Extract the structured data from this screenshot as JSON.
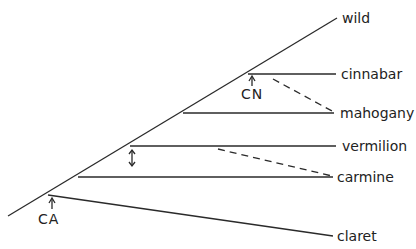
{
  "diagram": {
    "type": "phylogenetic-tree",
    "trunk_label": "wild",
    "branches": [
      {
        "label": "cinnabar"
      },
      {
        "label": "mahogany"
      },
      {
        "label": "vermilion"
      },
      {
        "label": "carmine"
      },
      {
        "label": "claret"
      }
    ],
    "markers": [
      {
        "label": "CN",
        "arrow": "up"
      },
      {
        "label": "V",
        "arrow": "double"
      },
      {
        "label": "CA",
        "arrow": "up"
      }
    ],
    "colors": {
      "line": "#2a2a2a",
      "text": "#222222",
      "background": "#ffffff"
    }
  }
}
